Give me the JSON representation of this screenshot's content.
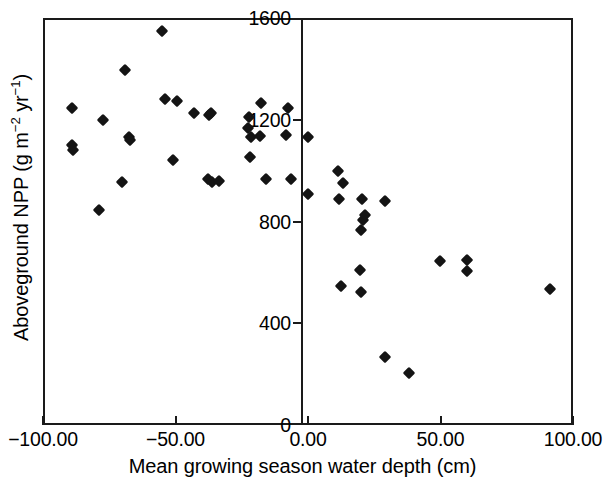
{
  "chart_data": {
    "type": "scatter",
    "title": "",
    "xlabel": "Mean growing season water depth (cm)",
    "ylabel": "Aboveground NPP (g m-2 yr-1)",
    "ylabel_parts": {
      "prefix": "Aboveground NPP (g m",
      "exp1": "−2",
      "mid": " yr",
      "exp2": "−1",
      "suffix": ")"
    },
    "xlim": [
      -100,
      100
    ],
    "ylim": [
      0,
      1600
    ],
    "xticks": [
      -100,
      -50,
      0,
      50,
      100
    ],
    "yticks": [
      0,
      400,
      800,
      1200,
      1600
    ],
    "xticklabels": [
      "−100.00",
      "−50.00",
      "0.00",
      "50.00",
      "100.00"
    ],
    "yticklabels": [
      "0",
      "400",
      "800",
      "1200",
      "1600"
    ],
    "grid": false,
    "legend": null,
    "marker": "diamond",
    "marker_color": "#141414",
    "series": [
      {
        "name": "Aboveground NPP vs water depth",
        "points": [
          [
            -89.1,
            1246
          ],
          [
            -77.4,
            1199
          ],
          [
            -89.0,
            1100
          ],
          [
            -88.8,
            1080
          ],
          [
            -78.7,
            845
          ],
          [
            -69.1,
            1397
          ],
          [
            -67.7,
            1132
          ],
          [
            -67.0,
            1120
          ],
          [
            -70.2,
            954
          ],
          [
            -55.0,
            1549
          ],
          [
            -54.0,
            1283
          ],
          [
            -49.5,
            1275
          ],
          [
            -51.0,
            1040
          ],
          [
            -43.1,
            1227
          ],
          [
            -37.4,
            1218
          ],
          [
            -36.5,
            1226
          ],
          [
            -37.6,
            966
          ],
          [
            -36.4,
            955
          ],
          [
            -33.7,
            958
          ],
          [
            -22.6,
            1167
          ],
          [
            -22.1,
            1212
          ],
          [
            -21.4,
            1132
          ],
          [
            -21.8,
            1055
          ],
          [
            -17.9,
            1266
          ],
          [
            -18.2,
            1135
          ],
          [
            -15.8,
            966
          ],
          [
            -7.6,
            1248
          ],
          [
            -8.2,
            1139
          ],
          [
            -6.5,
            966
          ],
          [
            0.0,
            1134
          ],
          [
            0.0,
            910
          ],
          [
            11.3,
            1000
          ],
          [
            13.2,
            950
          ],
          [
            11.7,
            890
          ],
          [
            20.4,
            890
          ],
          [
            20.8,
            805
          ],
          [
            21.5,
            825
          ],
          [
            20.0,
            765
          ],
          [
            29.0,
            880
          ],
          [
            12.5,
            546
          ],
          [
            19.8,
            610
          ],
          [
            20.0,
            523
          ],
          [
            28.9,
            268
          ],
          [
            38.0,
            205
          ],
          [
            49.8,
            645
          ],
          [
            60.0,
            650
          ],
          [
            60.0,
            605
          ],
          [
            91.3,
            535
          ]
        ]
      }
    ]
  }
}
